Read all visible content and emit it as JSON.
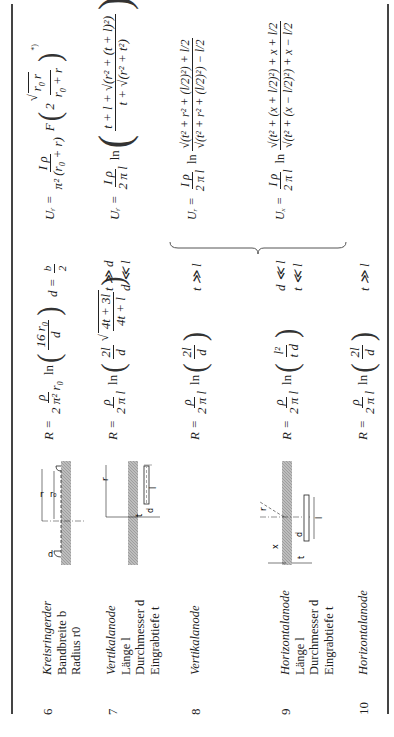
{
  "table": {
    "rows": [
      {
        "number": "6",
        "description": [
          "Kreisringerder",
          "Bandbreite b",
          "Radius r0"
        ],
        "drawing": "ring-earth-drawing",
        "r_formula": {
          "lhs": "R =",
          "coef_num": "ρ",
          "coef_den": "2 π² r₀",
          "fn": "ln",
          "arg_num": "16 r₀",
          "arg_den": "d"
        },
        "condition": [
          "d = b/2"
        ],
        "u_formula": {
          "lhs": "Uᵣ =",
          "coef_num": "I ρ",
          "coef_den": "π² (r₀ + r)",
          "fn": "F",
          "arg": "2 √(r₀ r) / (r₀ + r)",
          "footnote": "*)"
        }
      },
      {
        "number": "7",
        "description": [
          "Vertikalanode",
          "Länge l",
          "Durchmesser d",
          "Eingrabtiefe t"
        ],
        "drawing": "vertical-anode-drawing",
        "r_formula": {
          "lhs": "R =",
          "coef_num": "ρ",
          "coef_den": "2 π l",
          "fn": "ln",
          "arg_num": "2l",
          "arg_den": "d",
          "sqrt_num": "4t + 3l",
          "sqrt_den": "4t + l"
        },
        "condition": [
          "t ≫ d",
          "d ≪ l"
        ],
        "u_formula": {
          "lhs": "Uᵣ =",
          "coef_num": "I ρ",
          "coef_den": "2 π l",
          "fn": "ln",
          "arg_num": "t + l + √(r² + (t + l)²)",
          "arg_den": "t + √(r² + t²)"
        }
      },
      {
        "number": "8",
        "description": [
          "Vertikalanode"
        ],
        "drawing": "",
        "r_formula": {
          "lhs": "R =",
          "coef_num": "ρ",
          "coef_den": "2 π l",
          "fn": "ln",
          "arg_num": "2l",
          "arg_den": "d"
        },
        "condition": [
          "t ≫ l"
        ],
        "u_formula": {
          "lhs": "Uᵣ =",
          "coef_num": "I ρ",
          "coef_den": "2 π l",
          "fn": "ln",
          "arg_num": "√(t² + r² + (l/2)²) + l/2",
          "arg_den": "√(t² + r² + (l/2)²) − l/2"
        }
      },
      {
        "number": "9",
        "description": [
          "Horizontalanode",
          "Länge l",
          "Durchmesser d",
          "Eingrabtiefe t"
        ],
        "drawing": "horizontal-anode-drawing",
        "r_formula": {
          "lhs": "R =",
          "coef_num": "ρ",
          "coef_den": "2 π l",
          "fn": "ln",
          "arg_num": "l²",
          "arg_den": "t d"
        },
        "condition": [
          "d ≪ l",
          "t ≪ l"
        ],
        "u_formula": {
          "lhs": "Uₓ =",
          "coef_num": "I ρ",
          "coef_den": "2 π l",
          "fn": "ln",
          "arg_num": "√(t² + (x + l/2)²) + x + l/2",
          "arg_den": "√(t² + (x − l/2)²) + x − l/2"
        }
      },
      {
        "number": "10",
        "description": [
          "Horizontalanode"
        ],
        "drawing": "",
        "r_formula": {
          "lhs": "R =",
          "coef_num": "ρ",
          "coef_den": "2 π l",
          "fn": "ln",
          "arg_num": "2l",
          "arg_den": "d"
        },
        "condition": [
          "t ≫ l"
        ],
        "u_formula": null
      }
    ],
    "drawing_labels": {
      "row6": {
        "r": "r",
        "r0": "r₀",
        "d": "d"
      },
      "row7": {
        "r": "r",
        "l": "l",
        "d": "d"
      },
      "row9": {
        "r": "r",
        "t": "t",
        "x": "x",
        "l": "l",
        "d": "d"
      }
    },
    "brace_note": "rows 8 and 9 share brace"
  }
}
